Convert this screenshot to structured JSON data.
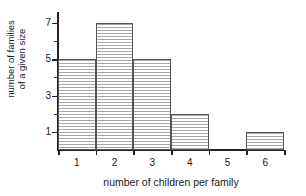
{
  "chart_data": {
    "type": "bar",
    "title": "",
    "xlabel": "number of children per family",
    "ylabel_line1": "number of families",
    "ylabel_line2": "of a given size",
    "categories": [
      "1",
      "2",
      "3",
      "4",
      "5",
      "6"
    ],
    "values": [
      5,
      7,
      5,
      2,
      0,
      1
    ],
    "ylim": [
      0,
      7.6
    ],
    "xlim": [
      0.5,
      6.5
    ],
    "y_major_ticks": [
      1,
      3,
      5,
      7
    ],
    "y_minor_ticks": [
      2,
      4,
      6
    ],
    "y_tick_labels": [
      "1",
      "3",
      "5",
      "7"
    ],
    "x_tick_boundaries": [
      0.5,
      1.5,
      2.5,
      3.5,
      4.5,
      5.5,
      6.5
    ],
    "grid": false,
    "legend": null,
    "bar_fill": "horizontal-hatch",
    "colors": {
      "axis": "#222222",
      "bar_edge": "#555555",
      "bar_hatch": "#a8a8a8",
      "background": "#ffffff",
      "text": "#1a1a1a"
    }
  }
}
